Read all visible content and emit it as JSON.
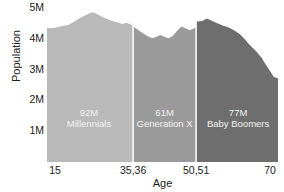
{
  "chart_data": {
    "type": "area",
    "title": "",
    "xlabel": "Age",
    "ylabel": "Population",
    "xlim": [
      15,
      70
    ],
    "ylim": [
      0,
      5000000
    ],
    "grid": false,
    "legend_position": "inline-band-labels",
    "y_ticks": [
      {
        "value": 5000000,
        "label": "5M"
      },
      {
        "value": 4000000,
        "label": "4M"
      },
      {
        "value": 3000000,
        "label": "3M"
      },
      {
        "value": 2000000,
        "label": "2M"
      },
      {
        "value": 1000000,
        "label": "1M"
      }
    ],
    "x_ticks": [
      {
        "value": 15,
        "label": "15"
      },
      {
        "value": 35.5,
        "label": "35,36"
      },
      {
        "value": 50.5,
        "label": "50,51"
      },
      {
        "value": 70,
        "label": "70"
      }
    ],
    "series": [
      {
        "name": "Millennials",
        "color": "#b9b9b9",
        "total_label": "92M",
        "age_start": 15,
        "age_end": 35,
        "x": [
          15,
          16,
          17,
          18,
          19,
          20,
          21,
          22,
          23,
          24,
          25,
          26,
          27,
          28,
          29,
          30,
          31,
          32,
          33,
          34,
          35
        ],
        "values": [
          4350000,
          4340000,
          4360000,
          4400000,
          4420000,
          4450000,
          4520000,
          4600000,
          4680000,
          4760000,
          4820000,
          4860000,
          4800000,
          4720000,
          4660000,
          4600000,
          4560000,
          4520000,
          4480000,
          4520000,
          4440000
        ]
      },
      {
        "name": "Generation X",
        "color": "#9a9a9a",
        "total_label": "61M",
        "age_start": 36,
        "age_end": 50,
        "x": [
          36,
          37,
          38,
          39,
          40,
          41,
          42,
          43,
          44,
          45,
          46,
          47,
          48,
          49,
          50
        ],
        "values": [
          4380000,
          4260000,
          4160000,
          4080000,
          4020000,
          4060000,
          4120000,
          4060000,
          4020000,
          4100000,
          4260000,
          4400000,
          4340000,
          4280000,
          4360000
        ]
      },
      {
        "name": "Baby Boomers",
        "color": "#6e6e6e",
        "total_label": "77M",
        "age_start": 51,
        "age_end": 70,
        "x": [
          51,
          52,
          53,
          54,
          55,
          56,
          57,
          58,
          59,
          60,
          61,
          62,
          63,
          64,
          65,
          66,
          67,
          68,
          69,
          70
        ],
        "values": [
          4560000,
          4580000,
          4660000,
          4600000,
          4540000,
          4480000,
          4420000,
          4380000,
          4320000,
          4240000,
          4140000,
          4000000,
          3840000,
          3700000,
          3560000,
          3400000,
          3180000,
          2980000,
          2760000,
          2720000
        ]
      }
    ]
  },
  "cohorts": [
    {
      "total": "92M",
      "name": "Millennials"
    },
    {
      "total": "61M",
      "name": "Generation X"
    },
    {
      "total": "77M",
      "name": "Baby Boomers"
    }
  ],
  "axes": {
    "y_title": "Population",
    "x_title": "Age"
  }
}
